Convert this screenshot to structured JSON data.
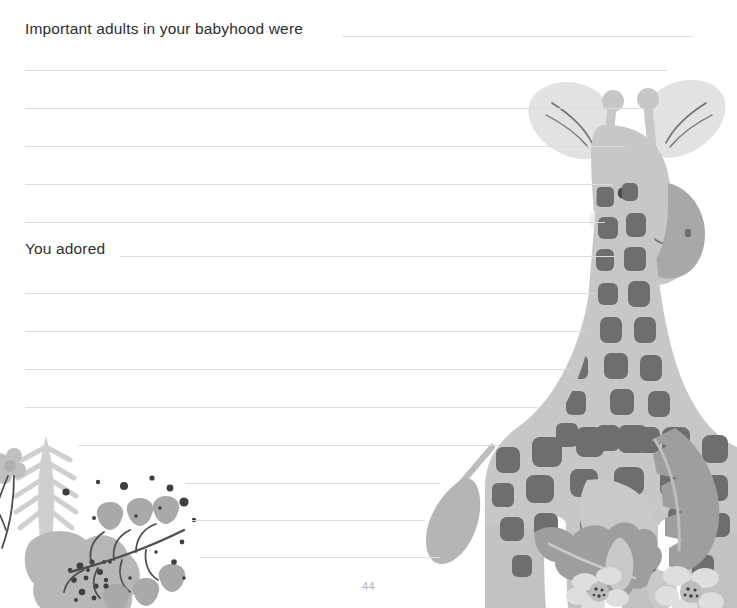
{
  "page": {
    "number": "44",
    "background_color": "#ffffff",
    "rule_color": "#dcdcdc",
    "text_color": "#2e2e2e"
  },
  "prompts": [
    {
      "id": "important-adults",
      "label": "Important adults in your babyhood were"
    },
    {
      "id": "you-adored",
      "label": "You adored"
    }
  ],
  "rules": [
    {
      "name": "rule-prompt-1",
      "x": 342,
      "y": 36,
      "width": 350
    },
    {
      "name": "rule-1",
      "x": 25,
      "y": 70,
      "width": 642
    },
    {
      "name": "rule-2",
      "x": 25,
      "y": 108,
      "width": 620
    },
    {
      "name": "rule-3",
      "x": 25,
      "y": 146,
      "width": 600
    },
    {
      "name": "rule-4",
      "x": 25,
      "y": 184,
      "width": 588
    },
    {
      "name": "rule-5",
      "x": 25,
      "y": 222,
      "width": 580
    },
    {
      "name": "rule-prompt-2",
      "x": 120,
      "y": 256,
      "width": 495
    },
    {
      "name": "rule-6",
      "x": 25,
      "y": 293,
      "width": 570
    },
    {
      "name": "rule-7",
      "x": 25,
      "y": 331,
      "width": 560
    },
    {
      "name": "rule-8",
      "x": 25,
      "y": 369,
      "width": 545
    },
    {
      "name": "rule-9",
      "x": 25,
      "y": 407,
      "width": 515
    },
    {
      "name": "rule-10",
      "x": 78,
      "y": 445,
      "width": 420
    },
    {
      "name": "rule-11",
      "x": 185,
      "y": 483,
      "width": 255
    },
    {
      "name": "rule-12",
      "x": 192,
      "y": 520,
      "width": 233
    },
    {
      "name": "rule-13",
      "x": 200,
      "y": 557,
      "width": 240
    }
  ],
  "artwork": {
    "giraffe": {
      "name": "giraffe-illustration",
      "body_color": "#c7c7c5",
      "body_shade_color": "#b9b9b7",
      "spot_color": "#6e6e6e",
      "muzzle_color": "#a8a8a6",
      "ear_color": "#e2e2e0",
      "eye_color": "#4a4a4a",
      "cheek_color": "#efefee"
    },
    "flora_left": {
      "name": "floral-decoration-left",
      "flower_color": "#b7b7b5",
      "leaf_color": "#cfcfcd",
      "stem_color": "#4e4e4e",
      "dot_color": "#3f3f3f",
      "tulip_color": "#a9a9a7"
    },
    "flora_right": {
      "name": "floral-decoration-right",
      "monstera_color": "#9e9e9c",
      "leaf_light_color": "#c9c9c7",
      "flower_color": "#dedede",
      "petal_color": "#bdbdbb",
      "center_color": "#5a5a5a"
    }
  }
}
